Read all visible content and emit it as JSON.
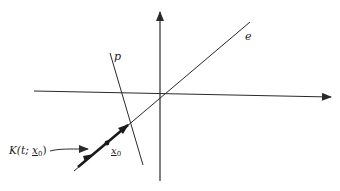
{
  "diagram": {
    "colors": {
      "stroke": "#2a2a2a",
      "background": "#ffffff"
    },
    "axes": {
      "horizontal": {
        "from": [
          34,
          91
        ],
        "to": [
          331,
          97
        ]
      },
      "vertical": {
        "from": [
          160,
          181
        ],
        "to": [
          160,
          12
        ]
      }
    },
    "lines": {
      "e": {
        "label": "e",
        "from": [
          74,
          171
        ],
        "to": [
          250,
          22
        ],
        "label_pos": [
          245,
          40
        ]
      },
      "p": {
        "label": "p",
        "from": [
          110,
          53
        ],
        "to": [
          143,
          165
        ],
        "label_pos": [
          114,
          60
        ]
      }
    },
    "trajectory": {
      "label": "K(t; x₀)",
      "label_main": "K(t; ",
      "label_x": "x",
      "label_sub": "0",
      "label_close": ")",
      "point_label_x": "x",
      "point_label_sub": "0",
      "point": [
        107,
        143
      ]
    }
  }
}
